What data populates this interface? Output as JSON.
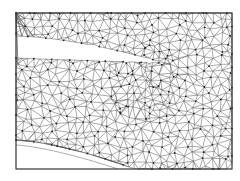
{
  "figure": {
    "type": "triangular-mesh",
    "frame": {
      "x": 16,
      "y": 13,
      "width": 216,
      "height": 156
    },
    "colors": {
      "background": "#ffffff",
      "edge": "#555555",
      "node": "#222222",
      "frame": "#333333",
      "curve": "#999999"
    },
    "slot": {
      "left_top_y": 36,
      "left_bottom_y": 58,
      "tip_x": 165,
      "tip_y": 63
    },
    "bottom_cut": {
      "mesh_start_y": 140,
      "mesh_end_x": 135,
      "inner_line_start_y": 145,
      "inner_line_end_x": 118
    },
    "mesh": {
      "seed": 7,
      "spacing": 8.5
    }
  }
}
